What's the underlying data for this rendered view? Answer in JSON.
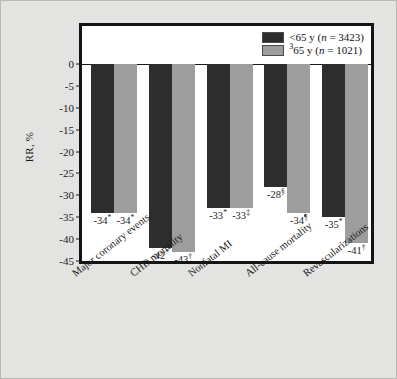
{
  "chart_data": {
    "type": "bar",
    "title": "",
    "xlabel": "",
    "ylabel": "RR, %",
    "ylim": [
      -45,
      0
    ],
    "yticks": [
      0,
      -5,
      -10,
      -15,
      -20,
      -25,
      -30,
      -35,
      -40,
      -45
    ],
    "ytick_labels": [
      "0",
      "-5",
      "-10",
      "-15",
      "-20",
      "-25",
      "-30",
      "-35",
      "-40",
      "-45"
    ],
    "grid": false,
    "legend_position": "top-right",
    "categories": [
      "Major coronary events",
      "CHD mortality",
      "Nonfatal MI",
      "All-cause mortality",
      "Revascularizations"
    ],
    "series": [
      {
        "name": "<65 y (n = 3423)",
        "color": "#2d2d2d",
        "values": [
          -34,
          -42,
          -33,
          -28,
          -35
        ],
        "data_labels": [
          "-34*",
          "-42*",
          "-33*",
          "-28§",
          "-35*"
        ],
        "label_numbers": [
          "-34",
          "-42",
          "-33",
          "-28",
          "-35"
        ],
        "label_marks": [
          "*",
          "*",
          "*",
          "§",
          "*"
        ]
      },
      {
        "name": "³65 y (n = 1021)",
        "color": "#9d9d9d",
        "values": [
          -34,
          -43,
          -33,
          -34,
          -41
        ],
        "data_labels": [
          "-34*",
          "-43†",
          "-33‡",
          "-34¶",
          "-41†"
        ],
        "label_numbers": [
          "-34",
          "-43",
          "-33",
          "-34",
          "-41"
        ],
        "label_marks": [
          "*",
          "†",
          "‡",
          "¶",
          "†"
        ]
      }
    ]
  },
  "legend": {
    "entries": [
      {
        "swatch": "dark",
        "prefix": "<65 y (",
        "italic": "n",
        "suffix": " = 3423)",
        "sup": ""
      },
      {
        "swatch": "light",
        "prefix": "65 y (",
        "italic": "n",
        "suffix": " = 1021)",
        "sup": "3"
      }
    ]
  },
  "axis": {
    "y_label": "RR, %"
  },
  "colors": {
    "series_under65": "#2d2d2d",
    "series_over65": "#9d9d9d",
    "canvas_background": "#e3e3e1",
    "plot_background": "#ffffff",
    "frame": "#141414"
  }
}
